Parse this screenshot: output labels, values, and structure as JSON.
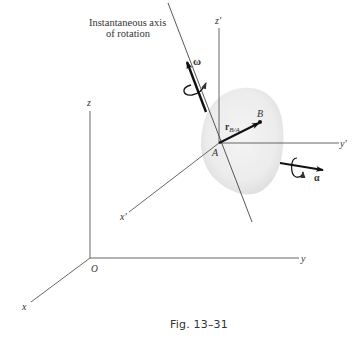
{
  "figure": {
    "callout": {
      "line1": "Instantaneous axis",
      "line2": "of rotation"
    },
    "fixed_axes": {
      "origin": "O",
      "x": "x",
      "y": "y",
      "z": "z"
    },
    "moving_axes": {
      "origin": "A",
      "x": "x'",
      "y": "y'",
      "z": "z'"
    },
    "point_b": "B",
    "position_vector": {
      "main": "r",
      "subscript": "B/A"
    },
    "angular_velocity": "ω",
    "angular_acceleration": "α",
    "colors": {
      "line": "#555555",
      "vector": "#111111",
      "body_fill": "#e9e9e9"
    }
  },
  "caption": "Fig. 13–31"
}
